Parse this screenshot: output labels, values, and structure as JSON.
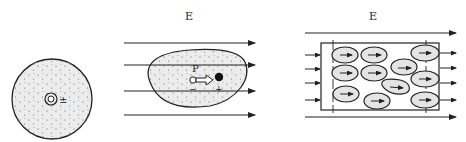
{
  "figure": {
    "panels": [
      {
        "id": "nonpolar-atom",
        "description": "Neutral atom with coincident charge centers (no field)",
        "center_symbol": "±"
      },
      {
        "id": "induced-dipole",
        "field_label": "E",
        "dipole_label": "P",
        "negative_sign": "−",
        "positive_sign": "+",
        "field_lines": 4
      },
      {
        "id": "polarized-dielectric",
        "field_label": "E",
        "molecule_negative_sign": "−",
        "molecule_positive_sign": "+",
        "molecule_count": 11,
        "external_field_lines_left": 4,
        "external_field_lines_right": 4
      }
    ],
    "colors": {
      "stroke": "#222222",
      "fill_region": "#e9e9e9",
      "background": "#ffffff"
    }
  }
}
